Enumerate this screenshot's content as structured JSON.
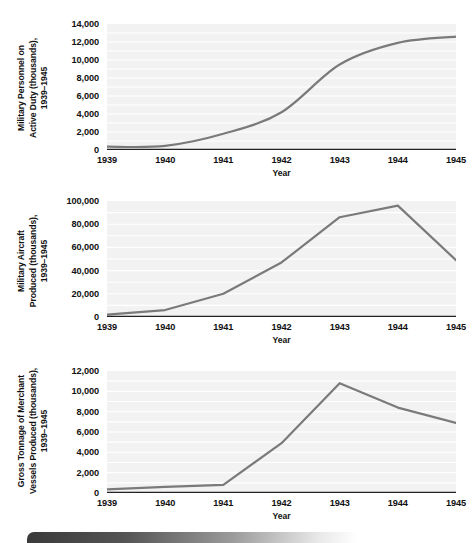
{
  "page": {
    "background_color": "#ffffff",
    "line_color": "#7a7a7a",
    "plot_background_color": "#f2f2f2",
    "gridline_color": "#ffffff",
    "axis_color": "#222222"
  },
  "footer": {
    "band_name": "page-footer-band"
  },
  "chart_data": [
    {
      "id": "military-personnel",
      "type": "line",
      "title": "",
      "ylabel": "Military Personnel on\nActive Duty (thousands),\n1939–1945",
      "xlabel": "Year",
      "categories": [
        "1939",
        "1940",
        "1941",
        "1942",
        "1943",
        "1944",
        "1945"
      ],
      "x": [
        1939,
        1940,
        1941,
        1942,
        1943,
        1944,
        1945
      ],
      "values": [
        370,
        460,
        1800,
        4200,
        9500,
        11900,
        12600
      ],
      "ylim": [
        0,
        14000
      ],
      "yticks": [
        0,
        2000,
        4000,
        6000,
        8000,
        10000,
        12000,
        14000
      ],
      "ytick_labels": [
        "0",
        "2,000",
        "4,000",
        "6,000",
        "8,000",
        "10,000",
        "12,000",
        "14,000"
      ],
      "xlim": [
        1939,
        1945
      ],
      "grid": true,
      "legend": "none",
      "smooth": true
    },
    {
      "id": "military-aircraft",
      "type": "line",
      "title": "",
      "ylabel": "Military Aircraft\nProduced (thousands),\n1939–1945",
      "xlabel": "Year",
      "categories": [
        "1939",
        "1940",
        "1941",
        "1942",
        "1943",
        "1944",
        "1945"
      ],
      "x": [
        1939,
        1940,
        1941,
        1942,
        1943,
        1944,
        1945
      ],
      "values": [
        2000,
        6000,
        20000,
        47000,
        86000,
        96000,
        49000
      ],
      "ylim": [
        0,
        100000
      ],
      "yticks": [
        0,
        20000,
        40000,
        60000,
        80000,
        100000
      ],
      "ytick_labels": [
        "0",
        "20,000",
        "40,000",
        "60,000",
        "80,000",
        "100,000"
      ],
      "xlim": [
        1939,
        1945
      ],
      "grid": true,
      "legend": "none",
      "smooth": false
    },
    {
      "id": "merchant-tonnage",
      "type": "line",
      "title": "",
      "ylabel": "Gross Tonnage of Merchant\nVessels Produced (thousands),\n1939–1945",
      "xlabel": "Year",
      "categories": [
        "1939",
        "1940",
        "1941",
        "1942",
        "1943",
        "1944",
        "1945"
      ],
      "x": [
        1939,
        1940,
        1941,
        1942,
        1943,
        1944,
        1945
      ],
      "values": [
        350,
        600,
        800,
        4900,
        10800,
        8400,
        6900
      ],
      "ylim": [
        0,
        12000
      ],
      "yticks": [
        0,
        2000,
        4000,
        6000,
        8000,
        10000,
        12000
      ],
      "ytick_labels": [
        "0",
        "2,000",
        "4,000",
        "6,000",
        "8,000",
        "10,000",
        "12,000"
      ],
      "xlim": [
        1939,
        1945
      ],
      "grid": true,
      "legend": "none",
      "smooth": false
    }
  ]
}
